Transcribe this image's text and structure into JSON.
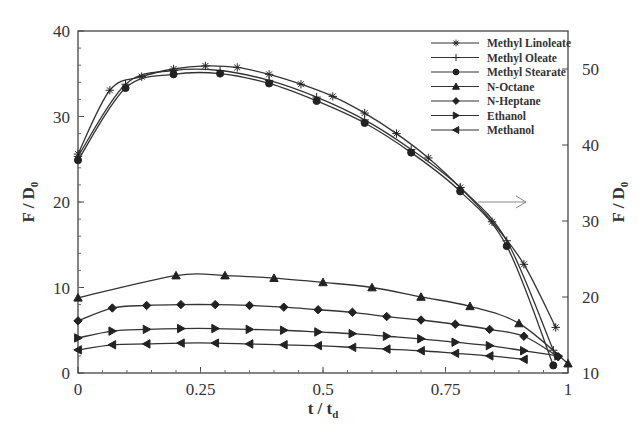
{
  "chart_data": {
    "type": "line",
    "title": "",
    "xlabel": "t / t_d",
    "ylabel": "F / D_0",
    "ylabel_right": "F / D_0",
    "xlim": [
      0,
      1
    ],
    "ylim": [
      0,
      40
    ],
    "ylim_right": [
      10,
      55
    ],
    "x_ticks": [
      "0",
      "0.25",
      "0.5",
      "0.75",
      "1"
    ],
    "y_ticks": [
      "0",
      "10",
      "20",
      "30",
      "40"
    ],
    "y_right_ticks": [
      "10",
      "20",
      "30",
      "40",
      "50"
    ],
    "grid": false,
    "legend_position": "upper right",
    "annotation": "arrow pointing to right axis",
    "series": [
      {
        "name": "Methyl Linoleate",
        "axis": "right",
        "marker": "star",
        "x": [
          0,
          0.065,
          0.13,
          0.195,
          0.26,
          0.325,
          0.39,
          0.455,
          0.52,
          0.585,
          0.65,
          0.715,
          0.78,
          0.845,
          0.91,
          0.975
        ],
        "y": [
          38.8,
          47.2,
          49.0,
          50.0,
          50.4,
          50.2,
          49.3,
          48.0,
          46.4,
          44.2,
          41.5,
          38.3,
          34.4,
          29.9,
          24.3,
          16.0
        ]
      },
      {
        "name": "Methyl Oleate",
        "axis": "right",
        "marker": "plus",
        "x": [
          0,
          0.097,
          0.195,
          0.29,
          0.39,
          0.487,
          0.585,
          0.68,
          0.78,
          0.875,
          0.97
        ],
        "y": [
          38.5,
          48.0,
          49.8,
          49.8,
          48.5,
          46.3,
          43.3,
          39.4,
          34.4,
          27.4,
          13.0
        ]
      },
      {
        "name": "Methyl Stearate",
        "axis": "right",
        "marker": "circle",
        "x": [
          0,
          0.097,
          0.195,
          0.29,
          0.39,
          0.487,
          0.585,
          0.68,
          0.78,
          0.875,
          0.97
        ],
        "y": [
          38.0,
          47.5,
          49.3,
          49.4,
          48.1,
          45.8,
          42.9,
          39.0,
          33.9,
          26.7,
          11.0
        ]
      },
      {
        "name": "N-Octane",
        "axis": "left",
        "marker": "triangle-up",
        "x": [
          0,
          0.2,
          0.3,
          0.4,
          0.5,
          0.6,
          0.7,
          0.8,
          0.9,
          1.0
        ],
        "y": [
          8.8,
          11.4,
          11.4,
          11.1,
          10.6,
          10.0,
          8.9,
          7.8,
          5.8,
          1.1
        ]
      },
      {
        "name": "N-Heptane",
        "axis": "left",
        "marker": "diamond",
        "x": [
          0,
          0.07,
          0.14,
          0.21,
          0.28,
          0.35,
          0.42,
          0.49,
          0.56,
          0.63,
          0.7,
          0.77,
          0.84,
          0.91,
          0.98
        ],
        "y": [
          6.1,
          7.6,
          7.9,
          8.0,
          8.0,
          7.9,
          7.7,
          7.4,
          7.1,
          6.6,
          6.2,
          5.7,
          5.1,
          4.3,
          1.9
        ]
      },
      {
        "name": "Ethanol",
        "axis": "left",
        "marker": "triangle-right",
        "x": [
          0,
          0.07,
          0.14,
          0.21,
          0.28,
          0.35,
          0.42,
          0.49,
          0.56,
          0.63,
          0.7,
          0.77,
          0.84,
          0.91,
          0.98
        ],
        "y": [
          4.1,
          4.9,
          5.1,
          5.2,
          5.2,
          5.1,
          5.0,
          4.8,
          4.6,
          4.3,
          4.0,
          3.6,
          3.2,
          2.6,
          2.0
        ]
      },
      {
        "name": "Methanol",
        "axis": "left",
        "marker": "triangle-left",
        "x": [
          0,
          0.07,
          0.14,
          0.21,
          0.28,
          0.35,
          0.42,
          0.49,
          0.56,
          0.63,
          0.7,
          0.77,
          0.84,
          0.91
        ],
        "y": [
          2.7,
          3.3,
          3.4,
          3.5,
          3.5,
          3.4,
          3.3,
          3.2,
          3.0,
          2.8,
          2.6,
          2.3,
          2.0,
          1.6
        ]
      }
    ]
  }
}
